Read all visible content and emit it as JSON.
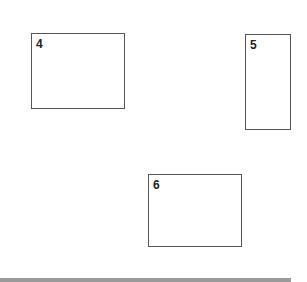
{
  "boxes": [
    {
      "label": "4",
      "x": 31,
      "y": 33,
      "w": 94,
      "h": 76
    },
    {
      "label": "5",
      "x": 245,
      "y": 34,
      "w": 46,
      "h": 96
    },
    {
      "label": "6",
      "x": 148,
      "y": 174,
      "w": 94,
      "h": 73
    }
  ],
  "colors": {
    "border": "#555555",
    "bottom_bar": "#9a9a9a",
    "background": "#ffffff"
  }
}
